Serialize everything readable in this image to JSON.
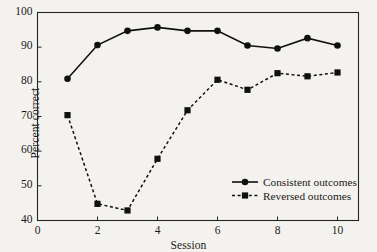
{
  "chart_data": {
    "type": "line",
    "title": "",
    "xlabel": "Session",
    "ylabel": "Percent correct",
    "x": [
      1,
      2,
      3,
      4,
      5,
      6,
      7,
      8,
      9,
      10
    ],
    "xlim": [
      0,
      10.7
    ],
    "ylim": [
      40,
      100
    ],
    "xticks": [
      0,
      2,
      4,
      6,
      8,
      10
    ],
    "xtick_labels": [
      "0",
      "2",
      "4",
      "6",
      "8",
      "10"
    ],
    "yticks": [
      40,
      50,
      60,
      70,
      80,
      90,
      100
    ],
    "ytick_labels": [
      "40",
      "50",
      "60",
      "70",
      "80",
      "90",
      "100"
    ],
    "grid": false,
    "legend_position": "lower right",
    "series": [
      {
        "name": "Consistent outcomes",
        "marker": "circle",
        "linestyle": "solid",
        "color": "#101010",
        "values": [
          80.9,
          90.6,
          94.7,
          95.7,
          94.7,
          94.7,
          90.5,
          89.6,
          92.6,
          90.5
        ]
      },
      {
        "name": "Reversed outcomes",
        "marker": "square",
        "linestyle": "dashed",
        "color": "#101010",
        "values": [
          70.4,
          44.8,
          42.9,
          57.8,
          71.8,
          80.6,
          77.7,
          82.5,
          81.6,
          82.7
        ]
      }
    ]
  },
  "legend": {
    "items": [
      {
        "label": "Consistent outcomes"
      },
      {
        "label": "Reversed outcomes"
      }
    ]
  }
}
